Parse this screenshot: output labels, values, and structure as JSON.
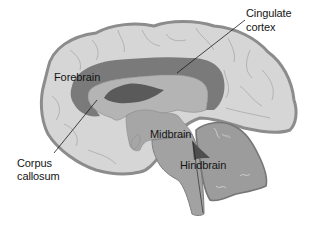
{
  "diagram": {
    "type": "brain-sagittal-section",
    "colors": {
      "background": "#ffffff",
      "cortex_fill": "#d6d6d6",
      "cortex_outline": "#8c8c8c",
      "cingulate_fill": "#7a7a7a",
      "corpus_callosum_fill": "#a8a8a8",
      "ventricle_fill": "#5a5a5a",
      "brainstem_fill": "#a2a2a2",
      "cerebellum_fill": "#9c9c9c",
      "label_text": "#141414",
      "leader_line": "#1a1a1a"
    },
    "labels": {
      "cingulate_line1": "Cingulate",
      "cingulate_line2": "cortex",
      "forebrain": "Forebrain",
      "midbrain": "Midbrain",
      "hindbrain": "Hindbrain",
      "corpus_line1": "Corpus",
      "corpus_line2": "callosum"
    }
  }
}
